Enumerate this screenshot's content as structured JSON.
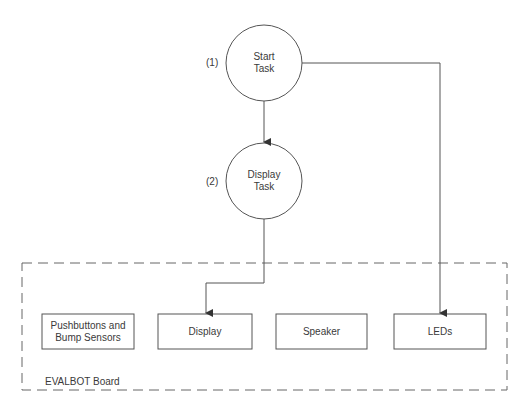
{
  "diagram": {
    "tasks": [
      {
        "id": "start",
        "number": "(1)",
        "line1": "Start",
        "line2": "Task"
      },
      {
        "id": "display",
        "number": "(2)",
        "line1": "Display",
        "line2": "Task"
      }
    ],
    "board": {
      "label": "EVALBOT Board",
      "components": [
        {
          "line1": "Pushbuttons and",
          "line2": "Bump Sensors"
        },
        {
          "line1": "Display",
          "line2": ""
        },
        {
          "line1": "Speaker",
          "line2": ""
        },
        {
          "line1": "LEDs",
          "line2": ""
        }
      ]
    },
    "edges": [
      {
        "from": "Start Task",
        "to": "Display Task"
      },
      {
        "from": "Start Task",
        "to": "LEDs"
      },
      {
        "from": "Display Task",
        "to": "Display"
      }
    ],
    "colors": {
      "stroke": "#555555",
      "dash": "#666666",
      "text": "#3a3a3a"
    }
  }
}
